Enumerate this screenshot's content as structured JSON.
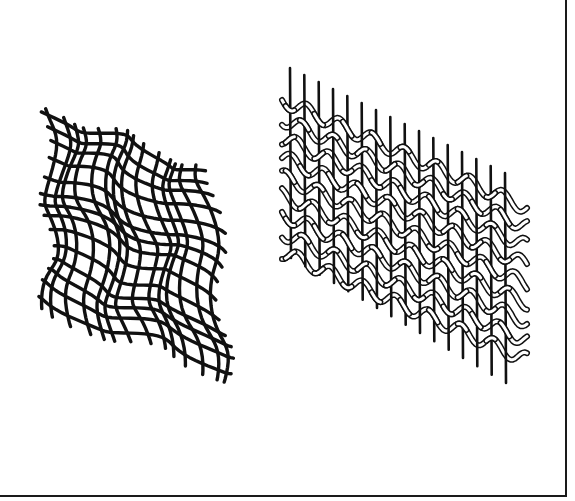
{
  "figure": {
    "background": "#ffffff",
    "line_color": "#111111",
    "frame": {
      "right_border": true,
      "bottom_border": true
    },
    "panels": [
      {
        "id": "left",
        "description": "irregular wavy woven mesh (distorted net)",
        "bounds": {
          "x": 45,
          "y": 95,
          "width": 195,
          "height": 280
        },
        "warp_count": 14,
        "weft_count": 14,
        "stroke_width": 3.4
      },
      {
        "id": "right",
        "description": "straight vertical rods interlaced with hollow wavy weft strands",
        "bounds": {
          "x": 280,
          "y": 65,
          "width": 240,
          "height": 320
        },
        "rod_count": 16,
        "weft_count": 9,
        "rod_stroke_width": 2.6
      }
    ]
  }
}
